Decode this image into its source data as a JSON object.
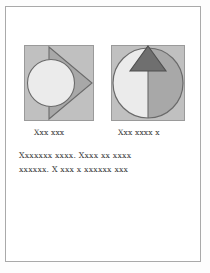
{
  "page": {
    "background_color": "#fdfdfd",
    "frame_color": "#a9a9a9",
    "paper_color": "#ffffff"
  },
  "palette": {
    "square_fill": "#c0c0c0",
    "square_stroke": "#9a9a9a",
    "light_shape": "#ebebeb",
    "mid_shape": "#a8a8a8",
    "dark_shape": "#6f6f6f",
    "outline": "#6a6a6a",
    "text_color": "#3b3b3b"
  },
  "figures": [
    {
      "name": "circle-and-right-triangle-figure",
      "panel": "left",
      "shapes": [
        {
          "type": "square",
          "fill": "#c0c0c0"
        },
        {
          "type": "circle",
          "fill": "#ebebeb",
          "position": "left-center"
        },
        {
          "type": "triangle",
          "fill": "#a8a8a8",
          "direction": "right"
        }
      ],
      "caption": "Xxx xxx"
    },
    {
      "name": "split-circle-and-up-triangle-figure",
      "panel": "right",
      "shapes": [
        {
          "type": "square",
          "fill": "#c0c0c0"
        },
        {
          "type": "semicircle",
          "fill": "#ebebeb",
          "position": "left-half"
        },
        {
          "type": "semicircle",
          "fill": "#a8a8a8",
          "position": "right-half"
        },
        {
          "type": "triangle",
          "fill": "#6f6f6f",
          "direction": "up"
        }
      ],
      "caption": "Xxx xxxx x"
    }
  ],
  "captions": {
    "left": "Xxx xxx",
    "right": "Xxx xxxx x"
  },
  "body_text": {
    "line1": "Xxxxxxx xxxx. Xxxx xx xxxx",
    "line2": "xxxxxx. X xxx x xxxxxx xxx"
  }
}
